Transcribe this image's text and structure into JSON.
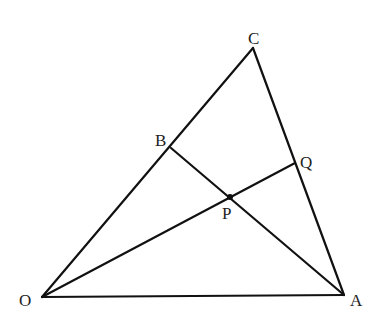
{
  "diagram": {
    "type": "geometry",
    "points": {
      "O": {
        "label": "O",
        "x": 42,
        "y": 297,
        "lx": 19,
        "ly": 306
      },
      "A": {
        "label": "A",
        "x": 344,
        "y": 295,
        "lx": 350,
        "ly": 306
      },
      "C": {
        "label": "C",
        "x": 253,
        "y": 48,
        "lx": 248,
        "ly": 44
      },
      "B": {
        "label": "B",
        "x": 171,
        "y": 148,
        "lx": 155,
        "ly": 146
      },
      "P": {
        "label": "P",
        "x": 230,
        "y": 197,
        "lx": 222,
        "ly": 219
      },
      "Q": {
        "label": "Q",
        "x": 295,
        "y": 163,
        "lx": 300,
        "ly": 168
      }
    },
    "segments": [
      {
        "from": "O",
        "to": "A"
      },
      {
        "from": "O",
        "to": "C"
      },
      {
        "from": "C",
        "to": "A"
      },
      {
        "from": "B",
        "to": "A"
      },
      {
        "from": "O",
        "to": "Q"
      }
    ],
    "marked_points": [
      "P"
    ],
    "colors": {
      "line": "#111111",
      "label": "#222222",
      "background": "#ffffff"
    }
  }
}
